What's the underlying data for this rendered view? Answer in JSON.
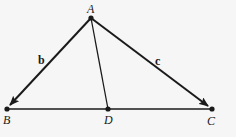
{
  "figure": {
    "points": {
      "A": {
        "label": "A",
        "x": 91,
        "y": 18
      },
      "B": {
        "label": "B",
        "x": 7,
        "y": 109
      },
      "C": {
        "label": "C",
        "x": 212,
        "y": 109
      },
      "D": {
        "label": "D",
        "x": 108,
        "y": 109
      }
    },
    "vectors": {
      "b": {
        "label": "b",
        "from": "A",
        "to": "B"
      },
      "c": {
        "label": "c",
        "from": "A",
        "to": "C"
      }
    },
    "segments": [
      {
        "from": "B",
        "to": "C"
      },
      {
        "from": "A",
        "to": "D"
      }
    ],
    "colors": {
      "line": "#1a1a1a",
      "background": "#f6f6f6"
    }
  }
}
